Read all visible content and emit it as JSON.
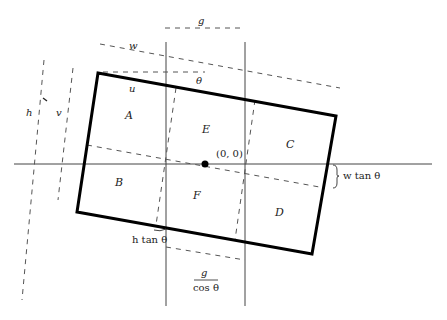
{
  "figure": {
    "regions": {
      "A": "A",
      "B": "B",
      "C": "C",
      "D": "D",
      "E": "E",
      "F": "F"
    },
    "origin_label": "(0, 0)",
    "labels": {
      "g": "g",
      "w": "w",
      "theta": "θ",
      "u": "u",
      "h": "h",
      "v": "v",
      "w_tan_theta": "w tan θ",
      "h_tan_theta": "h tan θ",
      "g_over_cos_num": "g",
      "g_over_cos_den": "cos θ"
    },
    "colors": {
      "outline": "#000000",
      "axis": "#444444",
      "dashed": "#555555"
    }
  }
}
